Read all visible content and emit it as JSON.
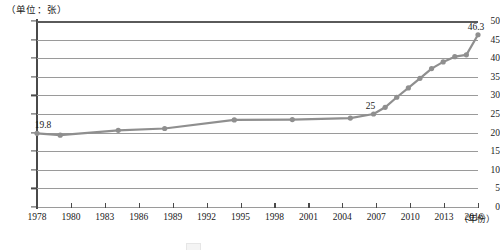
{
  "chart_data": {
    "type": "line",
    "title": "",
    "unit_label": "（单位：张）",
    "xlabel": "（年份）",
    "ylabel": "",
    "ylim": [
      0,
      50
    ],
    "y_ticks": [
      0,
      5,
      10,
      15,
      20,
      25,
      30,
      35,
      40,
      45,
      50
    ],
    "x_tick_labels": [
      "1978",
      "1980",
      "1983",
      "1986",
      "1989",
      "1992",
      "1995",
      "1998",
      "2001",
      "2004",
      "2007",
      "2010",
      "2013",
      "2016"
    ],
    "xlim": [
      1978,
      2016
    ],
    "grid": true,
    "legend_position": "bottom",
    "series_color": "#8f8f8f",
    "x": [
      1978,
      1980,
      1985,
      1989,
      1995,
      2000,
      2005,
      2007,
      2008,
      2009,
      2010,
      2011,
      2012,
      2013,
      2014,
      2015,
      2016
    ],
    "values": [
      19.8,
      19.3,
      20.6,
      21.1,
      23.4,
      23.5,
      23.9,
      25.0,
      26.8,
      29.5,
      32.0,
      34.6,
      37.2,
      39.0,
      40.4,
      40.9,
      46.3
    ],
    "point_labels": [
      {
        "x": 1978,
        "value": 19.8,
        "text": "19.8"
      },
      {
        "x": 2007,
        "value": 25.0,
        "text": "25"
      },
      {
        "x": 2016,
        "value": 46.3,
        "text": "46.3"
      }
    ]
  }
}
